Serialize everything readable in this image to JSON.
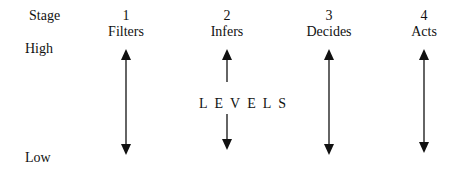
{
  "row_label": "Stage",
  "scale": {
    "high": "High",
    "low": "Low"
  },
  "stages": [
    {
      "number": "1",
      "name": "Filters"
    },
    {
      "number": "2",
      "name": "Infers"
    },
    {
      "number": "3",
      "name": "Decides"
    },
    {
      "number": "4",
      "name": "Acts"
    }
  ],
  "center_label": "LEVELS",
  "colors": {
    "ink": "#111111",
    "background": "#ffffff"
  }
}
